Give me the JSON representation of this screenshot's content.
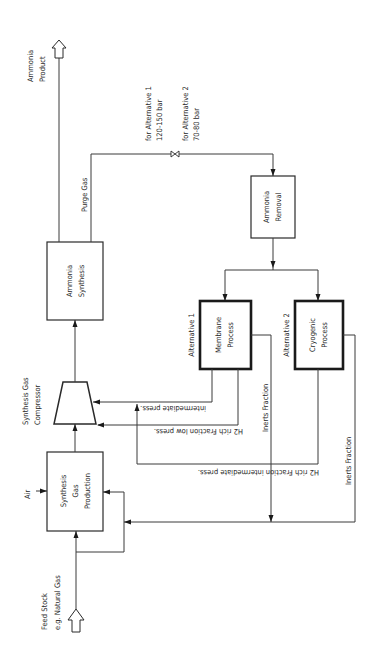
{
  "diagram": {
    "orientation": "rotated 90 degrees counter-clockwise",
    "nodes": {
      "synthesis_gas_production": {
        "line1": "Synthesis",
        "line2": "Gas",
        "line3": "Production"
      },
      "compressor": {
        "line1": "Synthesis Gas",
        "line2": "Compressor"
      },
      "ammonia_synthesis": {
        "line1": "Ammonia",
        "line2": "Synthesis"
      },
      "ammonia_removal": {
        "line1": "Ammonia",
        "line2": "Removal"
      },
      "membrane_process": {
        "line1": "Membrane",
        "line2": "Process",
        "caption": "Alternative 1"
      },
      "cryogenic_process": {
        "line1": "Cryogenic",
        "line2": "Process",
        "caption": "Alternative 2"
      }
    },
    "labels": {
      "feed_stock_1": "Feed Stock",
      "feed_stock_2": "e.g. Natural Gas",
      "air": "Air",
      "ammonia_product_1": "Ammonia",
      "ammonia_product_2": "Product",
      "purge_gas": "Purge Gas",
      "alt1_pressure_1": "for Alternative 1",
      "alt1_pressure_2": "120-150 bar",
      "alt2_pressure_1": "for Alternative 2",
      "alt2_pressure_2": "70-80 bar",
      "intermediate_press": "intermediate press.",
      "h2_low_press": "H2 rich Fraction low press.",
      "h2_intermediate_press": "H2 rich Fraction intermediate press.",
      "inerts_fraction_1": "Inerts Fraction",
      "inerts_fraction_2": "Inerts Fraction"
    },
    "edges": [
      {
        "from": "feed_stock",
        "to": "synthesis_gas_production"
      },
      {
        "from": "air",
        "to": "synthesis_gas_production"
      },
      {
        "from": "synthesis_gas_production",
        "to": "compressor"
      },
      {
        "from": "compressor",
        "to": "ammonia_synthesis"
      },
      {
        "from": "ammonia_synthesis",
        "to": "ammonia_product"
      },
      {
        "from": "ammonia_synthesis",
        "to": "ammonia_removal",
        "label": "Purge Gas",
        "valve": true
      },
      {
        "from": "ammonia_removal",
        "to": "membrane_process"
      },
      {
        "from": "ammonia_removal",
        "to": "cryogenic_process"
      },
      {
        "from": "membrane_process",
        "to": "compressor",
        "label": "intermediate press."
      },
      {
        "from": "membrane_process",
        "to": "compressor",
        "label": "H2 rich Fraction low press."
      },
      {
        "from": "cryogenic_process",
        "to": "compressor",
        "label": "H2 rich Fraction intermediate press."
      },
      {
        "from": "membrane_process",
        "to": "synthesis_gas_production",
        "label": "Inerts Fraction"
      },
      {
        "from": "cryogenic_process",
        "to": "synthesis_gas_production",
        "label": "Inerts Fraction"
      }
    ]
  }
}
